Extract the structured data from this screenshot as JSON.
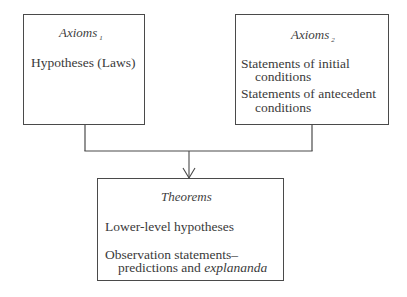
{
  "diagram": {
    "type": "flow",
    "boxes": {
      "axioms1": {
        "title": "Axioms",
        "subscript": "1",
        "items": [
          "Hypotheses (Laws)"
        ]
      },
      "axioms2": {
        "title": "Axioms",
        "subscript": "2",
        "items": [
          {
            "line1": "Statements of initial",
            "line2": "conditions"
          },
          {
            "line1": "Statements of antecedent",
            "line2": "conditions"
          }
        ]
      },
      "theorems": {
        "title": "Theorems",
        "items": [
          "Lower-level hypotheses",
          {
            "line1": "Observation statements–",
            "line2_prefix": "predictions and ",
            "line2_emphasis": "explananda"
          }
        ]
      }
    },
    "edges": [
      {
        "from": "axioms1",
        "to": "theorems",
        "style": "line-merge"
      },
      {
        "from": "axioms2",
        "to": "theorems",
        "style": "line-merge"
      },
      {
        "from": "merge",
        "to": "theorems",
        "style": "arrow"
      }
    ],
    "colors": {
      "stroke": "#4a4a4a",
      "text": "#3a3a3a",
      "background": "#ffffff"
    }
  }
}
